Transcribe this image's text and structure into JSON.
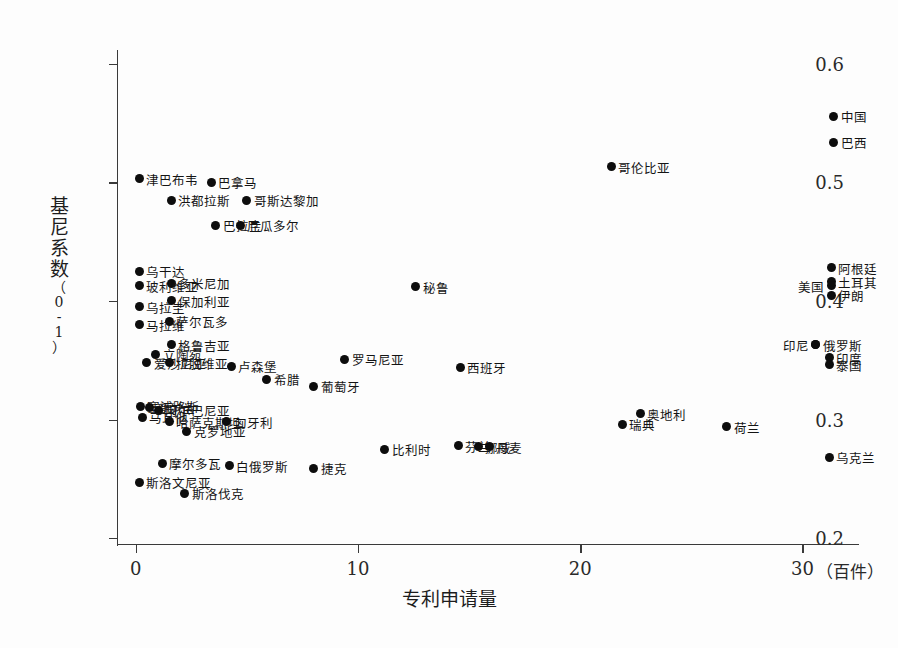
{
  "chart_data": {
    "type": "scatter",
    "title": "",
    "xlabel": "专利申请量",
    "x_unit": "（百件）",
    "ylabel": "基尼系数",
    "y_unit": "（0-1）",
    "xlim": [
      -0.8,
      32.5
    ],
    "ylim": [
      0.195,
      0.61
    ],
    "x_ticks": [
      "0",
      "10",
      "20",
      "30"
    ],
    "x_tick_values": [
      0,
      10,
      20,
      30
    ],
    "y_ticks": [
      "0.2",
      "0.3",
      "0.4",
      "0.5",
      "0.6"
    ],
    "y_tick_values": [
      0.2,
      0.3,
      0.4,
      0.5,
      0.6
    ],
    "grid": false,
    "legend": "none",
    "marker": "filled-circle-black",
    "points": [
      {
        "label": "中国",
        "x": 31.4,
        "y": 0.556,
        "side": "right"
      },
      {
        "label": "巴西",
        "x": 31.4,
        "y": 0.534,
        "side": "right"
      },
      {
        "label": "哥伦比亚",
        "x": 21.4,
        "y": 0.513,
        "side": "right"
      },
      {
        "label": "津巴布韦",
        "x": 0.15,
        "y": 0.503,
        "side": "right"
      },
      {
        "label": "巴拿马",
        "x": 3.4,
        "y": 0.5,
        "side": "right"
      },
      {
        "label": "洪都拉斯",
        "x": 1.6,
        "y": 0.485,
        "side": "right"
      },
      {
        "label": "哥斯达黎加",
        "x": 5.0,
        "y": 0.485,
        "side": "right"
      },
      {
        "label": "巴拉圭",
        "x": 3.6,
        "y": 0.464,
        "side": "right"
      },
      {
        "label": "厄瓜多尔",
        "x": 4.7,
        "y": 0.464,
        "side": "right"
      },
      {
        "label": "阿根廷",
        "x": 31.3,
        "y": 0.428,
        "side": "right"
      },
      {
        "label": "乌干达",
        "x": 0.15,
        "y": 0.425,
        "side": "right"
      },
      {
        "label": "土耳其",
        "x": 31.3,
        "y": 0.416,
        "side": "right"
      },
      {
        "label": "美国",
        "x": 31.3,
        "y": 0.413,
        "side": "left"
      },
      {
        "label": "多米尼加",
        "x": 1.6,
        "y": 0.415,
        "side": "right"
      },
      {
        "label": "玻利维亚",
        "x": 0.15,
        "y": 0.413,
        "side": "right"
      },
      {
        "label": "秘鲁",
        "x": 12.6,
        "y": 0.412,
        "side": "right"
      },
      {
        "label": "伊朗",
        "x": 31.3,
        "y": 0.405,
        "side": "right"
      },
      {
        "label": "保加利亚",
        "x": 1.6,
        "y": 0.4,
        "side": "right"
      },
      {
        "label": "乌拉圭",
        "x": 0.15,
        "y": 0.395,
        "side": "right"
      },
      {
        "label": "萨尔瓦多",
        "x": 1.5,
        "y": 0.383,
        "side": "right"
      },
      {
        "label": "马拉维",
        "x": 0.15,
        "y": 0.38,
        "side": "right"
      },
      {
        "label": "俄罗斯",
        "x": 30.6,
        "y": 0.363,
        "side": "right"
      },
      {
        "label": "印尼",
        "x": 30.6,
        "y": 0.363,
        "side": "left"
      },
      {
        "label": "格鲁吉亚",
        "x": 1.6,
        "y": 0.363,
        "side": "right"
      },
      {
        "label": "立陶宛",
        "x": 0.9,
        "y": 0.355,
        "side": "right"
      },
      {
        "label": "印度",
        "x": 31.2,
        "y": 0.352,
        "side": "right"
      },
      {
        "label": "罗马尼亚",
        "x": 9.4,
        "y": 0.351,
        "side": "right"
      },
      {
        "label": "拉脱维亚",
        "x": 1.5,
        "y": 0.348,
        "side": "right"
      },
      {
        "label": "爱沙尼亚",
        "x": 0.5,
        "y": 0.348,
        "side": "right"
      },
      {
        "label": "泰国",
        "x": 31.2,
        "y": 0.346,
        "side": "right"
      },
      {
        "label": "卢森堡",
        "x": 4.3,
        "y": 0.345,
        "side": "right"
      },
      {
        "label": "西班牙",
        "x": 14.6,
        "y": 0.344,
        "side": "right"
      },
      {
        "label": "希腊",
        "x": 5.9,
        "y": 0.334,
        "side": "right"
      },
      {
        "label": "葡萄牙",
        "x": 8.0,
        "y": 0.328,
        "side": "right"
      },
      {
        "label": "塞浦路斯",
        "x": 0.2,
        "y": 0.311,
        "side": "right"
      },
      {
        "label": "爱尔兰",
        "x": 0.6,
        "y": 0.31,
        "side": "right"
      },
      {
        "label": "阿尔巴尼亚",
        "x": 1.0,
        "y": 0.308,
        "side": "right"
      },
      {
        "label": "奥地利",
        "x": 22.7,
        "y": 0.305,
        "side": "right"
      },
      {
        "label": "马耳他",
        "x": 0.3,
        "y": 0.302,
        "side": "right"
      },
      {
        "label": "哈萨克斯坦",
        "x": 1.5,
        "y": 0.298,
        "side": "right"
      },
      {
        "label": "匈牙利",
        "x": 4.1,
        "y": 0.298,
        "side": "right"
      },
      {
        "label": "瑞典",
        "x": 21.9,
        "y": 0.296,
        "side": "right"
      },
      {
        "label": "荷兰",
        "x": 26.6,
        "y": 0.294,
        "side": "right"
      },
      {
        "label": "克罗地亚",
        "x": 2.3,
        "y": 0.29,
        "side": "right"
      },
      {
        "label": "芬兰",
        "x": 14.5,
        "y": 0.278,
        "side": "right"
      },
      {
        "label": "挪威",
        "x": 15.4,
        "y": 0.277,
        "side": "right"
      },
      {
        "label": "丹麦",
        "x": 15.9,
        "y": 0.277,
        "side": "right"
      },
      {
        "label": "比利时",
        "x": 11.2,
        "y": 0.275,
        "side": "right"
      },
      {
        "label": "乌克兰",
        "x": 31.2,
        "y": 0.268,
        "side": "right"
      },
      {
        "label": "摩尔多瓦",
        "x": 1.2,
        "y": 0.263,
        "side": "right"
      },
      {
        "label": "白俄罗斯",
        "x": 4.2,
        "y": 0.261,
        "side": "right"
      },
      {
        "label": "捷克",
        "x": 8.0,
        "y": 0.259,
        "side": "right"
      },
      {
        "label": "斯洛文尼亚",
        "x": 0.15,
        "y": 0.247,
        "side": "right"
      },
      {
        "label": "斯洛伐克",
        "x": 2.2,
        "y": 0.238,
        "side": "right"
      }
    ]
  }
}
